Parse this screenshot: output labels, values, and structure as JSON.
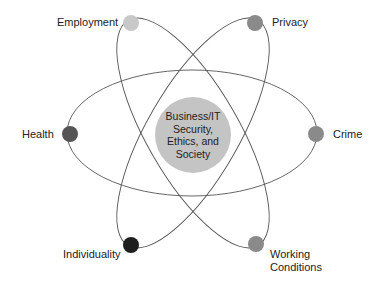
{
  "diagram": {
    "center": {
      "lines": [
        "Business/IT",
        "Security,",
        "Ethics, and",
        "Society"
      ],
      "color": "#c4c4c4"
    },
    "nodes": [
      {
        "id": "employment",
        "label": "Employment",
        "color": "#c8c8c8"
      },
      {
        "id": "privacy",
        "label": "Privacy",
        "color": "#8a8a8a"
      },
      {
        "id": "health",
        "label": "Health",
        "color": "#555555"
      },
      {
        "id": "crime",
        "label": "Crime",
        "color": "#8a8a8a"
      },
      {
        "id": "individuality",
        "label": "Individuality",
        "color": "#1e1e1e"
      },
      {
        "id": "working-conditions",
        "label": [
          "Working",
          "Conditions"
        ],
        "color": "#8a8a8a"
      }
    ],
    "orbit_color": "#555555"
  }
}
